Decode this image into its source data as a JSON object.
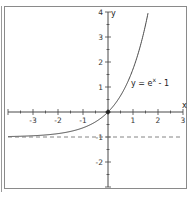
{
  "chart_data": {
    "type": "line",
    "title": "",
    "function_label": "y = e^x - 1",
    "function_label_parts": {
      "base": "y = e",
      "exponent": "x",
      "tail": " - 1"
    },
    "xlabel": "x",
    "ylabel": "y",
    "xlim": [
      -4,
      3
    ],
    "ylim": [
      -3,
      4
    ],
    "x_ticks": [
      -3,
      -2,
      -1,
      1,
      2,
      3
    ],
    "y_ticks": [
      -2,
      -1,
      1,
      2,
      3,
      4
    ],
    "x_tick_labels": [
      "-3",
      "-2",
      "-1",
      "1",
      "2",
      "3"
    ],
    "y_tick_labels": [
      "-2",
      "-1",
      "1",
      "2",
      "3",
      "4"
    ],
    "minor_tick_step": 0.5,
    "series": [
      {
        "name": "y = e^x - 1",
        "style": "solid",
        "x": [
          -4,
          -3,
          -2,
          -1.5,
          -1,
          -0.5,
          0,
          0.5,
          1,
          1.25,
          1.5,
          1.609
        ],
        "y": [
          -0.98,
          -0.95,
          -0.86,
          -0.78,
          -0.63,
          -0.39,
          0,
          0.65,
          1.72,
          2.49,
          3.48,
          4.0
        ]
      },
      {
        "name": "asymptote y = -1",
        "style": "dashed",
        "x": [
          -4,
          3
        ],
        "y": [
          -1,
          -1
        ]
      }
    ],
    "highlighted_points": [
      {
        "x": 0,
        "y": 0
      }
    ],
    "grid": false,
    "legend": "none"
  }
}
